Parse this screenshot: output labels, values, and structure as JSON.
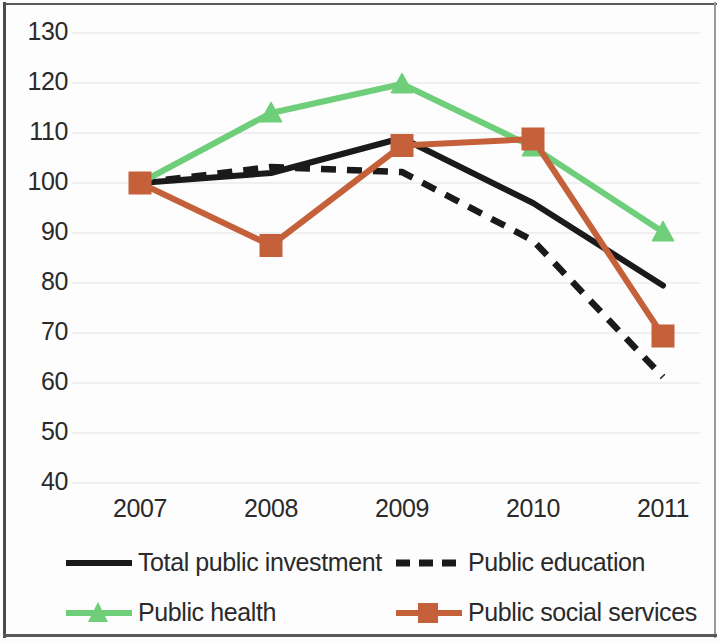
{
  "chart_data": {
    "type": "line",
    "title": "",
    "xlabel": "",
    "ylabel": "",
    "categories": [
      "2007",
      "2008",
      "2009",
      "2010",
      "2011"
    ],
    "x_tick_labels": [
      "2007",
      "2008",
      "2009",
      "2010",
      "2011"
    ],
    "y_tick_labels": [
      "130",
      "120",
      "110",
      "100",
      "90",
      "80",
      "70",
      "60",
      "50",
      "40"
    ],
    "ylim": [
      40,
      130
    ],
    "ytick_step": 10,
    "grid": "horizontal-only",
    "legend_position": "bottom",
    "series": [
      {
        "name": "Total public investment",
        "key": "total_public_investment",
        "color": "#1a1a1a",
        "style": "solid",
        "marker": "none",
        "values": [
          100,
          102,
          109,
          96,
          79.5
        ]
      },
      {
        "name": "Public education",
        "key": "public_education",
        "color": "#1a1a1a",
        "style": "dashed",
        "marker": "none",
        "values": [
          100,
          103.2,
          102.2,
          88.5,
          61.2
        ]
      },
      {
        "name": "Public health",
        "key": "public_health",
        "color": "#6ece7a",
        "style": "solid",
        "marker": "triangle",
        "values": [
          100,
          114,
          119.8,
          107.2,
          90.2
        ]
      },
      {
        "name": "Public social services",
        "key": "public_social_services",
        "color": "#c4603a",
        "style": "solid",
        "marker": "square",
        "values": [
          100,
          87.5,
          107.5,
          108.8,
          69.4
        ]
      }
    ]
  },
  "legend": {
    "items": [
      {
        "label": "Total public investment",
        "color": "#1a1a1a",
        "style": "solid",
        "marker": "none"
      },
      {
        "label": "Public education",
        "color": "#1a1a1a",
        "style": "dashed",
        "marker": "none"
      },
      {
        "label": "Public health",
        "color": "#6ece7a",
        "style": "solid",
        "marker": "triangle"
      },
      {
        "label": "Public social services",
        "color": "#c4603a",
        "style": "solid",
        "marker": "square"
      }
    ]
  },
  "colors": {
    "black": "#1a1a1a",
    "green": "#6ece7a",
    "orange": "#c4603a",
    "gridline": "#e2e2e2",
    "text": "#2a2a2a",
    "background": "#fdfdfd"
  }
}
